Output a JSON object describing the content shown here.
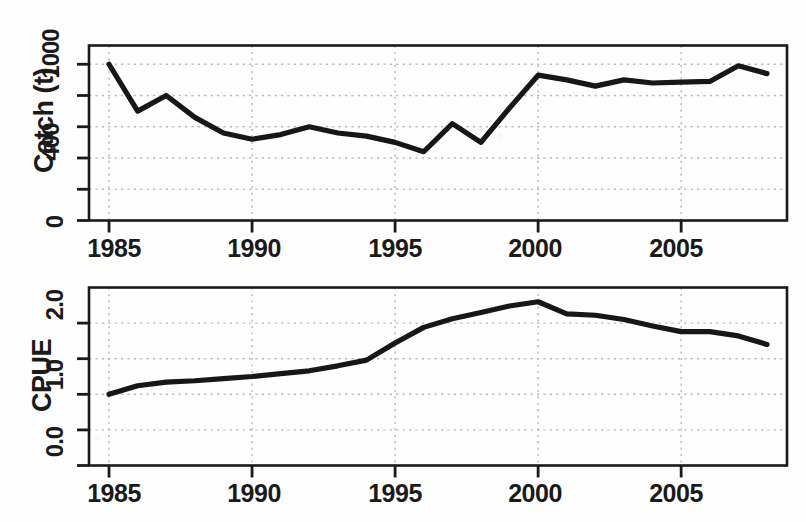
{
  "figure": {
    "background": "#fefefe",
    "line_color": "#171717",
    "grid_color": "#b9b9b9",
    "axis_color": "#1a1a1a"
  },
  "chart_data": [
    {
      "type": "line",
      "id": "catch",
      "title": "",
      "xlabel": "",
      "ylabel": "Catch (t)",
      "xlim": [
        1984.3,
        2008.7
      ],
      "ylim": [
        0,
        1120
      ],
      "grid": true,
      "legend": "none",
      "xticks": [
        1985,
        1990,
        1995,
        2000,
        2005
      ],
      "xtick_labels": [
        "1985",
        "1990",
        "1995",
        "2000",
        "2005"
      ],
      "yticks": [
        0,
        200,
        400,
        600,
        800,
        1000
      ],
      "ytick_labels": [
        "0",
        "",
        "400",
        "",
        "",
        "1000"
      ],
      "x": [
        1985,
        1986,
        1987,
        1988,
        1989,
        1990,
        1991,
        1992,
        1993,
        1994,
        1995,
        1996,
        1997,
        1998,
        1999,
        2000,
        2001,
        2002,
        2003,
        2004,
        2005,
        2006,
        2007,
        2008
      ],
      "values": [
        1000,
        700,
        800,
        660,
        560,
        520,
        550,
        600,
        560,
        540,
        500,
        440,
        620,
        500,
        720,
        930,
        900,
        860,
        900,
        880,
        885,
        890,
        990,
        940
      ]
    },
    {
      "type": "line",
      "id": "cpue",
      "title": "",
      "xlabel": "",
      "ylabel": "CPUE",
      "xlim": [
        1984.3,
        2008.7
      ],
      "ylim": [
        0.0,
        2.5
      ],
      "grid": true,
      "legend": "none",
      "xticks": [
        1985,
        1990,
        1995,
        2000,
        2005
      ],
      "xtick_labels": [
        "1985",
        "1990",
        "1995",
        "2000",
        "2005"
      ],
      "yticks": [
        0.0,
        0.5,
        1.0,
        1.5,
        2.0
      ],
      "ytick_labels": [
        "0.0",
        "",
        "1.0",
        "",
        "2.0"
      ],
      "x": [
        1985,
        1986,
        1987,
        1988,
        1989,
        1990,
        1991,
        1992,
        1993,
        1994,
        1995,
        1996,
        1997,
        1998,
        1999,
        2000,
        2001,
        2002,
        2003,
        2004,
        2005,
        2006,
        2007,
        2008
      ],
      "values": [
        1.0,
        1.12,
        1.17,
        1.19,
        1.22,
        1.25,
        1.29,
        1.33,
        1.4,
        1.48,
        1.72,
        1.94,
        2.06,
        2.15,
        2.24,
        2.3,
        2.13,
        2.11,
        2.05,
        1.96,
        1.88,
        1.88,
        1.82,
        1.7
      ]
    }
  ],
  "panels": {
    "catch": {
      "y_axis_title": "Catch (t)",
      "y_labels": [
        "1000",
        "400",
        "0"
      ],
      "x_labels": [
        "1985",
        "1990",
        "1995",
        "2000",
        "2005"
      ]
    },
    "cpue": {
      "y_axis_title": "CPUE",
      "y_labels": [
        "2.0",
        "1.0",
        "0.0"
      ],
      "x_labels": [
        "1985",
        "1990",
        "1995",
        "2000",
        "2005"
      ]
    }
  }
}
